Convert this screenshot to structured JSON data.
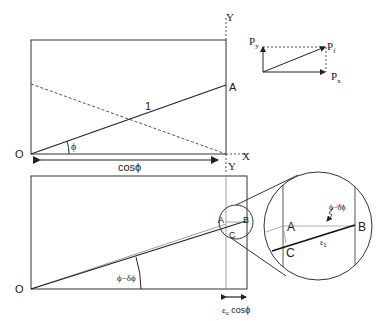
{
  "top_diagram": {
    "origin_label": "O",
    "point_a_label": "A",
    "unit_length_label": "1",
    "angle_label": "ϕ",
    "base_length_label": "cosϕ",
    "y_axis_label": "Y",
    "x_axis_label": "X",
    "y_axis_bottom_label": "Y"
  },
  "vector_diagram": {
    "py_label": "P",
    "py_sub": "y",
    "pf_label": "P",
    "pf_sub": "f",
    "px_label": "P",
    "px_sub": "x"
  },
  "bottom_diagram": {
    "origin_label": "O",
    "angle_label": "ϕ−δϕ",
    "point_a_label": "A",
    "point_b_label": "B",
    "point_c_label": "C",
    "strain_label_main": "ε",
    "strain_label_sub": "c",
    "strain_label_tail": " cosϕ"
  },
  "zoom_inset": {
    "point_a_label": "A",
    "point_b_label": "B",
    "point_c_label": "C",
    "angle_label": "ϕ−δϕ",
    "strain_main": "ε",
    "strain_sub": "1"
  },
  "colors": {
    "line": "#222222",
    "dashed": "#555555",
    "thin": "#888888",
    "angle_annot": "#cc3333"
  }
}
